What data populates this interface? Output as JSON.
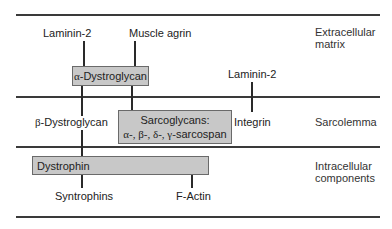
{
  "regions": [
    {
      "line1": "Extracellular",
      "line2": "matrix"
    },
    {
      "line1": "Sarcolemma"
    },
    {
      "line1": "Intracellular",
      "line2": "components"
    }
  ],
  "nodes": {
    "laminin_left": "Laminin-2",
    "muscle_agrin": "Muscle agrin",
    "alpha_dystroglycan_prefix": "α",
    "alpha_dystroglycan": "-Dystroglycan",
    "laminin_right": "Laminin-2",
    "beta_dystroglycan_prefix": "β",
    "beta_dystroglycan": "-Dystroglycan",
    "sarcoglycans_title": "Sarcoglycans:",
    "sarcoglycans_greek": "α-, β-, δ-, γ-",
    "sarcoglycans_suffix": "sarcospan",
    "integrin": "Integrin",
    "dystrophin": "Dystrophin",
    "syntrophins": "Syntrophins",
    "f_actin": "F-Actin"
  },
  "colors": {
    "box_fill": "#c8c8c8",
    "box_border": "#6a6a6a",
    "line": "#3a3a3a"
  }
}
